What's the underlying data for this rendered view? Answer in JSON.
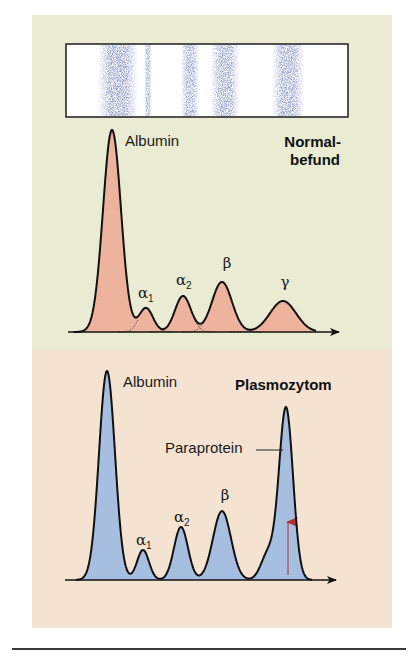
{
  "chart_data": [
    {
      "type": "area",
      "title": "Normalbefund",
      "title_lines": [
        "Normal-",
        "befund"
      ],
      "description": "Serum protein electrophoresis densitometry curve with gel strip",
      "fill_color": "#eeb39c",
      "background_color": "#e9ecd2",
      "xlabel": "",
      "ylabel": "",
      "grid": false,
      "gel_strip": {
        "bands": [
          {
            "name": "Albumin",
            "x": 118,
            "width": 22,
            "intensity": 0.95
          },
          {
            "name": "alpha1",
            "x": 148,
            "width": 4,
            "intensity": 0.8
          },
          {
            "name": "alpha2",
            "x": 190,
            "width": 10,
            "intensity": 0.85
          },
          {
            "name": "beta",
            "x": 225,
            "width": 16,
            "intensity": 0.9
          },
          {
            "name": "gamma",
            "x": 288,
            "width": 18,
            "intensity": 0.9
          }
        ]
      },
      "categories": [
        "Albumin",
        "α1",
        "α2",
        "β",
        "γ"
      ],
      "peaks": [
        {
          "label": "Albumin",
          "x": 112,
          "height": 202,
          "sigma": 9
        },
        {
          "label": "α1",
          "x": 146,
          "height": 24,
          "sigma": 7
        },
        {
          "label": "α2",
          "x": 183,
          "height": 36,
          "sigma": 8
        },
        {
          "label": "β",
          "x": 222,
          "height": 50,
          "sigma": 10
        },
        {
          "label": "γ",
          "x": 283,
          "height": 31,
          "sigma": 13
        }
      ],
      "values": [
        202,
        24,
        36,
        50,
        31
      ]
    },
    {
      "type": "area",
      "title": "Plasmozytom",
      "fill_color": "#a6bfe0",
      "background_color": "#f5e3d1",
      "xlabel": "",
      "ylabel": "",
      "grid": false,
      "categories": [
        "Albumin",
        "α1",
        "α2",
        "β",
        "Paraprotein"
      ],
      "peaks": [
        {
          "label": "Albumin",
          "x": 107,
          "height": 209,
          "sigma": 8
        },
        {
          "label": "α1",
          "x": 143,
          "height": 30,
          "sigma": 6
        },
        {
          "label": "α2",
          "x": 181,
          "height": 53,
          "sigma": 7
        },
        {
          "label": "β",
          "x": 222,
          "height": 69,
          "sigma": 9
        },
        {
          "label": "shoulder",
          "x": 268,
          "height": 26,
          "sigma": 7
        },
        {
          "label": "Paraprotein",
          "x": 286,
          "height": 172,
          "sigma": 7
        }
      ],
      "values": [
        209,
        30,
        53,
        69,
        172
      ],
      "annotation": {
        "text": "Paraprotein",
        "arrow_color": "#b03030"
      }
    }
  ],
  "top": {
    "title_line1": "Normal-",
    "title_line2": "befund",
    "labels": {
      "albumin": "Albumin",
      "alpha": "α",
      "alpha1_sub": "1",
      "alpha2_sub": "2",
      "beta": "β",
      "gamma": "γ"
    }
  },
  "bottom": {
    "title": "Plasmozytom",
    "labels": {
      "albumin": "Albumin",
      "alpha": "α",
      "alpha1_sub": "1",
      "alpha2_sub": "2",
      "beta": "β",
      "paraprotein": "Paraprotein"
    }
  }
}
